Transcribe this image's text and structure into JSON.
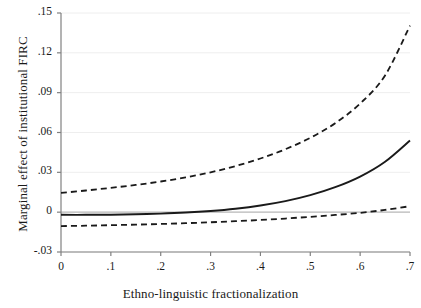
{
  "chart_data": {
    "type": "line",
    "title": "",
    "xlabel": "Ethno-linguistic fractionalization",
    "ylabel": "Marginal effect of institutional FIRC",
    "xlim": [
      0,
      0.7
    ],
    "ylim": [
      -0.03,
      0.15
    ],
    "xticks": [
      0,
      0.1,
      0.2,
      0.3,
      0.4,
      0.5,
      0.6,
      0.7
    ],
    "xtick_labels": [
      "0",
      ".1",
      ".2",
      ".3",
      ".4",
      ".5",
      ".6",
      ".7"
    ],
    "yticks": [
      -0.03,
      0,
      0.03,
      0.06,
      0.09,
      0.12,
      0.15
    ],
    "ytick_labels": [
      "-.03",
      "0",
      ".03",
      ".06",
      ".09",
      ".12",
      ".15"
    ],
    "grid": true,
    "grid_axis": "y",
    "legend": "none",
    "zero_reference_line": 0,
    "x": [
      0,
      0.05,
      0.1,
      0.15,
      0.2,
      0.25,
      0.3,
      0.35,
      0.4,
      0.45,
      0.5,
      0.55,
      0.6,
      0.65,
      0.7
    ],
    "series": [
      {
        "name": "upper-confidence-bound",
        "style": "dashed",
        "color": "#1a1a1a",
        "values": [
          0.0145,
          0.0163,
          0.0183,
          0.0205,
          0.0231,
          0.0262,
          0.03,
          0.0347,
          0.0404,
          0.0474,
          0.056,
          0.067,
          0.0818,
          0.103,
          0.1405
        ]
      },
      {
        "name": "marginal-effect",
        "style": "solid",
        "color": "#1a1a1a",
        "values": [
          -0.002,
          -0.002,
          -0.0019,
          -0.0016,
          -0.0011,
          -0.0003,
          0.0009,
          0.0026,
          0.005,
          0.0083,
          0.0128,
          0.0188,
          0.0268,
          0.038,
          0.054
        ]
      },
      {
        "name": "lower-confidence-bound",
        "style": "dashed",
        "color": "#1a1a1a",
        "values": [
          -0.0105,
          -0.0102,
          -0.0098,
          -0.0094,
          -0.0089,
          -0.0083,
          -0.0076,
          -0.0068,
          -0.0059,
          -0.0048,
          -0.0035,
          -0.0021,
          -0.0005,
          0.0017,
          0.0045
        ]
      }
    ],
    "colors": {
      "line": "#1a1a1a",
      "grid": "#eeeeee",
      "axis": "#808080",
      "zero_line": "#bbbbbb",
      "background": "#ffffff"
    }
  }
}
